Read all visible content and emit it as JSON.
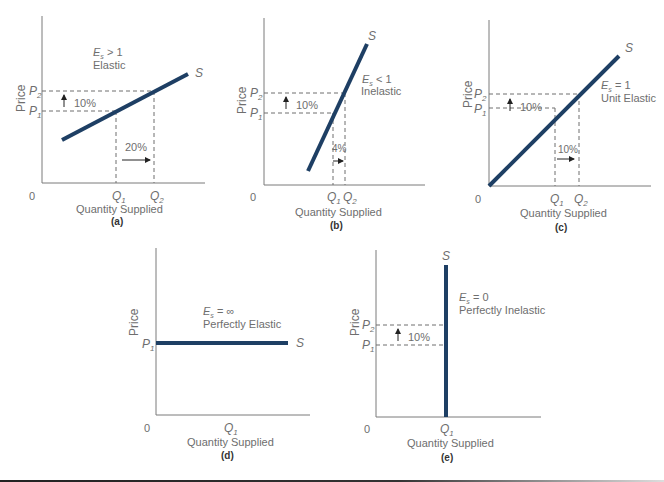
{
  "header_fragment": "(cropped caption text at top edge)",
  "colors": {
    "supply_line": "#1e3f64",
    "axis": "#7a7a7a",
    "text": "#6e6e6e",
    "dash": "#6e6e6e"
  },
  "common": {
    "y_axis_label": "Price",
    "x_axis_label": "Quantity Supplied",
    "origin": "0",
    "supply": "S",
    "p1": "P",
    "p1_sub": "1",
    "p2": "P",
    "p2_sub": "2",
    "q1": "Q",
    "q1_sub": "1",
    "q2": "Q",
    "q2_sub": "2",
    "es": "E",
    "es_sub": "s"
  },
  "panels": {
    "a": {
      "caption": "(a)",
      "es_rel": "> 1",
      "desc": "Elastic",
      "price_change": "10%",
      "qty_change": "20%"
    },
    "b": {
      "caption": "(b)",
      "es_rel": "< 1",
      "desc": "Inelastic",
      "price_change": "10%",
      "qty_change": "4%"
    },
    "c": {
      "caption": "(c)",
      "es_rel": "= 1",
      "desc": "Unit Elastic",
      "price_change": "10%",
      "qty_change": "10%"
    },
    "d": {
      "caption": "(d)",
      "es_rel": "= ∞",
      "desc": "Perfectly Elastic"
    },
    "e": {
      "caption": "(e)",
      "es_rel": "= 0",
      "desc": "Perfectly Inelastic",
      "price_change": "10%"
    }
  }
}
